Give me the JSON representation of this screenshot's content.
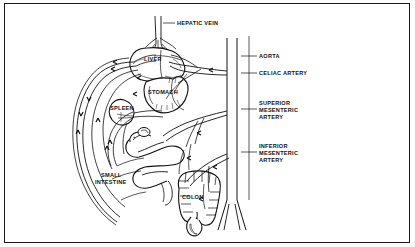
{
  "figure": {
    "border_color": "#1a1a1a",
    "background_color": "#ffffff",
    "ink_color": "#111111",
    "width": 415,
    "height": 247
  },
  "labels": {
    "hepatic_vein": "HEPATIC VEIN",
    "aorta": "AORTA",
    "celiac_artery": "CELIAC ARTERY",
    "superior_mesenteric_line1": "SUPERIOR",
    "superior_mesenteric_line2": "MESENTERIC",
    "superior_mesenteric_line3": "ARTERY",
    "inferior_mesenteric_line1": "INFERIOR",
    "inferior_mesenteric_line2": "MESENTERIC",
    "inferior_mesenteric_line3": "ARTERY",
    "liver": "LIVER",
    "stomach": "STOMACH",
    "spleen": "SPLEEN",
    "small_intestine_line1": "SMALL",
    "small_intestine_line2": "INTESTINE",
    "colon": "COLON"
  },
  "organs": [
    {
      "name": "liver",
      "label": "LIVER"
    },
    {
      "name": "stomach",
      "label": "STOMACH"
    },
    {
      "name": "spleen",
      "label": "SPLEEN"
    },
    {
      "name": "small-intestine",
      "label": "SMALL INTESTINE"
    },
    {
      "name": "colon",
      "label": "COLON"
    }
  ],
  "vessels": [
    {
      "name": "hepatic-vein",
      "label": "HEPATIC VEIN",
      "side": "top"
    },
    {
      "name": "aorta",
      "label": "AORTA",
      "side": "right"
    },
    {
      "name": "celiac-artery",
      "label": "CELIAC ARTERY",
      "side": "right"
    },
    {
      "name": "superior-mesenteric-artery",
      "label": "SUPERIOR MESENTERIC ARTERY",
      "side": "right"
    },
    {
      "name": "inferior-mesenteric-artery",
      "label": "INFERIOR MESENTERIC ARTERY",
      "side": "right"
    }
  ]
}
